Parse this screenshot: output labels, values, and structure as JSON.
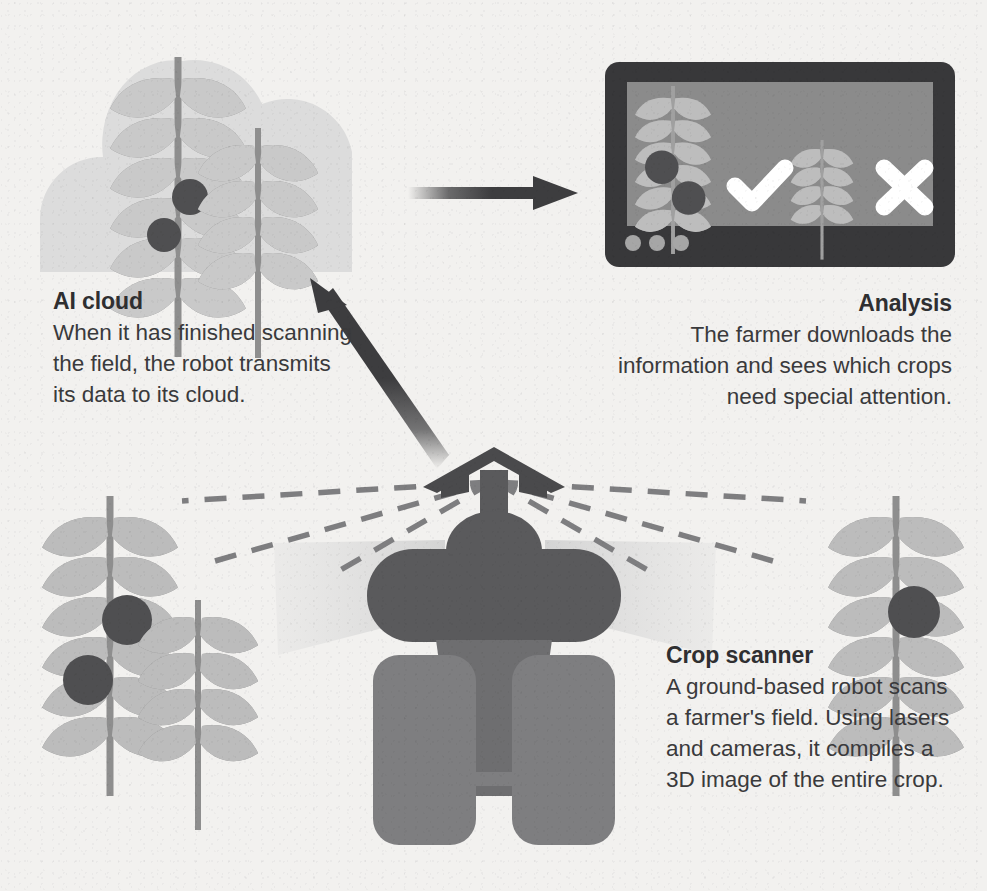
{
  "page": {
    "background": "#f2f1ef",
    "type": "infographic"
  },
  "sections": {
    "cloud": {
      "heading": "AI cloud",
      "body": "When it has finished scanning the field, the robot transmits its data to its cloud.",
      "icon": "cloud-icon"
    },
    "analysis": {
      "heading": "Analysis",
      "body": "The farmer downloads the information and sees which crops need special attention.",
      "icon": "monitor-screen-icon"
    },
    "scanner": {
      "heading": "Crop scanner",
      "body": "A ground-based robot scans a farmer's field. Using lasers and cameras, it compiles a 3D image of the entire crop.",
      "icon": "robot-icon"
    }
  },
  "screen": {
    "verdicts": [
      {
        "symbol": "check",
        "meaning": "healthy-crop-approved"
      },
      {
        "symbol": "cross",
        "meaning": "diseased-crop-rejected"
      }
    ],
    "indicator_dots": 3
  },
  "arrows": [
    {
      "name": "cloud-to-screen-arrow",
      "direction": "right"
    },
    {
      "name": "robot-to-cloud-arrow",
      "direction": "up-left"
    }
  ],
  "colors": {
    "background": "#f2f1ef",
    "cloud_fill": "#dcdcdc",
    "leaf_light": "#c3c3c3",
    "leaf_mid": "#b4b4b4",
    "stem": "#8e8e8e",
    "disease_dot": "#4f4f51",
    "bezel_dark": "#38383a",
    "screen_fill": "#8b8b8b",
    "robot_body": "#5a5a5c",
    "robot_wheel": "#7e7e80",
    "arrow_dark": "#3d3d3f",
    "scan_beam": "#dadada",
    "text": "#3a3a3c",
    "heading": "#2f2f31",
    "white": "#ffffff"
  },
  "plants": [
    {
      "name": "cloud-plant-tall",
      "leaf_pairs": 6,
      "disease_dots": 2
    },
    {
      "name": "cloud-plant-short",
      "leaf_pairs": 4,
      "disease_dots": 0
    },
    {
      "name": "screen-plant-diseased",
      "leaf_pairs": 6,
      "disease_dots": 2
    },
    {
      "name": "screen-plant-healthy",
      "leaf_pairs": 4,
      "disease_dots": 0
    },
    {
      "name": "field-plant-left-tall",
      "leaf_pairs": 6,
      "disease_dots": 2
    },
    {
      "name": "field-plant-left-short",
      "leaf_pairs": 4,
      "disease_dots": 0
    },
    {
      "name": "field-plant-right",
      "leaf_pairs": 6,
      "disease_dots": 1
    }
  ]
}
